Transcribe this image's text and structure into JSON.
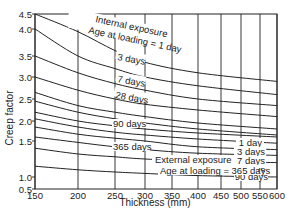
{
  "chart_data": {
    "type": "line",
    "title": "",
    "xlabel": "Thickness (mm)",
    "ylabel": "Creep factor",
    "xlim": [
      150,
      600
    ],
    "ylim": [
      0.5,
      4.5
    ],
    "grid": true,
    "x_ticks": [
      150,
      200,
      250,
      300,
      350,
      400,
      450,
      500,
      550,
      600
    ],
    "y_ticks": [
      0.5,
      1.0,
      1.5,
      2.0,
      2.5,
      3.0,
      3.5,
      4.0,
      4.5
    ],
    "y_tick_labels": [
      "0.5",
      "1.0",
      "1.5",
      "2.0",
      "2.5",
      "3.0",
      "3.5",
      "4.0",
      "4.5"
    ],
    "x": [
      150,
      200,
      250,
      300,
      400,
      600
    ],
    "groups": [
      {
        "name": "Internal exposure",
        "label_line1": "Internal exposure",
        "label_line2": "Age at loading = 1 day",
        "series": [
          {
            "name": "1 day",
            "values": [
              4.5,
              3.95,
              3.6,
              3.35,
              3.1,
              2.9
            ]
          },
          {
            "name": "3 days",
            "values": [
              4.0,
              3.5,
              3.2,
              3.0,
              2.8,
              2.6
            ]
          },
          {
            "name": "7 days",
            "values": [
              3.5,
              3.1,
              2.85,
              2.7,
              2.5,
              2.35
            ]
          },
          {
            "name": "28 days",
            "values": [
              3.0,
              2.7,
              2.5,
              2.38,
              2.25,
              2.1
            ]
          },
          {
            "name": "90 days",
            "values": [
              2.65,
              2.35,
              2.2,
              2.1,
              1.95,
              1.8
            ]
          },
          {
            "name": "365 days",
            "values": [
              2.45,
              2.2,
              2.05,
              1.95,
              1.8,
              1.65
            ]
          }
        ]
      },
      {
        "name": "External exposure",
        "label_line1": "External exposure",
        "label_line2": "Age at loading = 365 days",
        "series": [
          {
            "name": "1 day",
            "values": [
              2.2,
              2.0,
              1.88,
              1.8,
              1.7,
              1.6
            ]
          },
          {
            "name": "3 days",
            "values": [
              2.05,
              1.85,
              1.72,
              1.65,
              1.55,
              1.47
            ]
          },
          {
            "name": "7 days",
            "values": [
              1.85,
              1.67,
              1.57,
              1.5,
              1.42,
              1.38
            ]
          },
          {
            "name": "28 days",
            "values": [
              1.6,
              1.48,
              1.42,
              1.38,
              1.33,
              1.3
            ]
          },
          {
            "name": "90 days",
            "values": [
              1.4,
              1.32,
              1.28,
              1.25,
              1.22,
              1.2
            ]
          },
          {
            "name": "365 days",
            "values": [
              1.15,
              1.1,
              1.07,
              1.05,
              1.02,
              1.0
            ]
          }
        ]
      }
    ],
    "annotations": {
      "internal_inline_labels": [
        "3 days",
        "7 days",
        "28 days",
        "90 days",
        "365 days"
      ],
      "external_right_labels": [
        "1 day",
        "3 days",
        "7 days",
        "28 days",
        "90 days"
      ]
    }
  },
  "labels": {
    "ylabel": "Creep factor",
    "xlabel": "Thickness (mm)",
    "internal_line1": "Internal exposure",
    "internal_line2": "Age at loading = 1 day",
    "external_line1": "External exposure",
    "external_line2": "Age at loading = 365 days",
    "int_3": "3 days",
    "int_7": "7 days",
    "int_28": "28 days",
    "int_90": "90 days",
    "int_365": "365 days",
    "ext_1": "1 day",
    "ext_3": "3 days",
    "ext_7": "7 days",
    "ext_28": "28 days",
    "ext_90": "90 days"
  },
  "colors": {
    "line": "#222222",
    "grid": "#222222",
    "background": "#ffffff"
  }
}
